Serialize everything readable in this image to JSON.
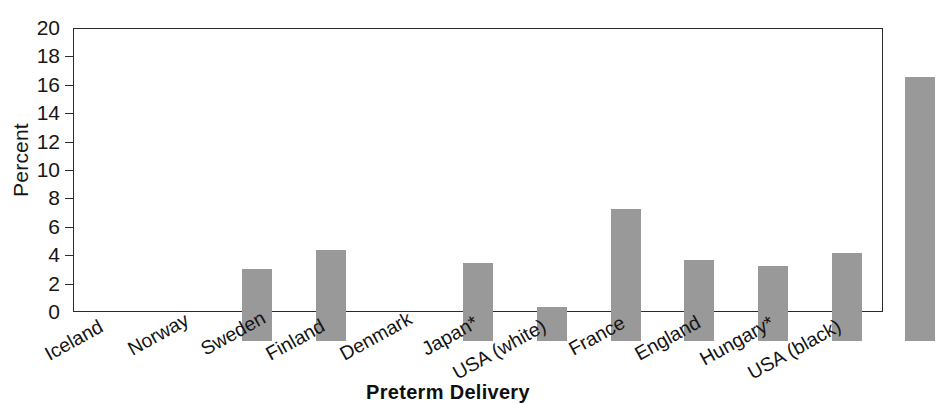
{
  "chart_data": {
    "type": "bar",
    "title": "",
    "xlabel": "Preterm Delivery",
    "ylabel": "Percent",
    "categories": [
      "Iceland",
      "Norway",
      "Sweden",
      "Finland",
      "Denmark",
      "Japan*",
      "USA (white)",
      "France",
      "England",
      "Hungary*",
      "USA (black)"
    ],
    "values": [
      0,
      5.1,
      6.4,
      0,
      5.5,
      2.4,
      9.3,
      5.7,
      5.3,
      6.2,
      18.6
    ],
    "ylim": [
      0,
      20
    ],
    "yticks": [
      0,
      2,
      4,
      6,
      8,
      10,
      12,
      14,
      16,
      18,
      20
    ],
    "ytick_labels": [
      "0",
      "2",
      "4",
      "6",
      "8",
      "10",
      "12",
      "14",
      "16",
      "18",
      "20"
    ],
    "grid": false,
    "legend": null,
    "bar_color": "#999999",
    "axis_color": "#2b2b2b",
    "label_rotation_deg": -29
  }
}
